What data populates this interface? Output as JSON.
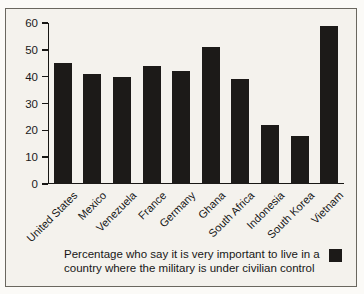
{
  "colors": {
    "background": "#f4f2ed",
    "frame_border": "#6a675f",
    "bar": "#1c1a18",
    "text": "#1a1a1a"
  },
  "caption": {
    "lines": [
      "Percentage who say it is very important to live in a",
      "country where the military is under civilian control"
    ]
  },
  "chart_data": {
    "type": "bar",
    "categories": [
      "United States",
      "Mexico",
      "Venezuela",
      "France",
      "Germany",
      "Ghana",
      "South Africa",
      "Indonesia",
      "South Korea",
      "Vietnam"
    ],
    "values": [
      45,
      41,
      40,
      44,
      42,
      51,
      39,
      22,
      18,
      59
    ],
    "title": "",
    "xlabel": "",
    "ylabel": "",
    "ylim": [
      0,
      60
    ],
    "yticks": [
      0,
      10,
      20,
      30,
      40,
      50,
      60
    ],
    "grid": false,
    "legend_position": "bottom-right",
    "legend_marker": "black-square"
  }
}
